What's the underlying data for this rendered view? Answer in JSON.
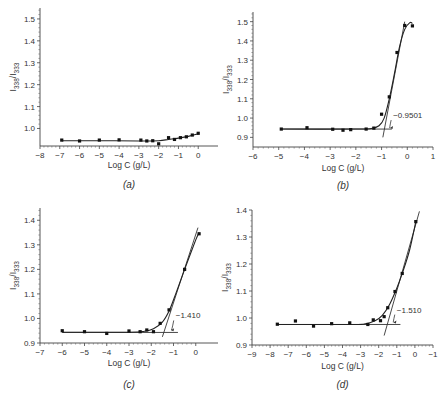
{
  "chart_data": [
    {
      "id": "a",
      "panel_label": "(a)",
      "type": "scatter",
      "xlabel": "Log C (g/L)",
      "ylabel": "I338/I333",
      "ylabel_main": "I",
      "ylabel_sub1": "338",
      "ylabel_sep": "/I",
      "ylabel_sub2": "333",
      "xlim": [
        -8,
        1
      ],
      "ylim": [
        0.92,
        1.55
      ],
      "xticks": [
        -8,
        -7,
        -6,
        -5,
        -4,
        -3,
        -2,
        -1,
        0
      ],
      "xtick_labels": [
        "−8",
        "−7",
        "−6",
        "−5",
        "−4",
        "−3",
        "−2",
        "−1",
        "0"
      ],
      "yticks": [
        1.0,
        1.1,
        1.2,
        1.3,
        1.4,
        1.5
      ],
      "ytick_labels": [
        "1.0",
        "1.1",
        "1.2",
        "1.3",
        "1.4",
        "1.5"
      ],
      "series": [
        {
          "name": "data",
          "x": [
            -6.9,
            -6.0,
            -5.0,
            -4.0,
            -2.9,
            -2.6,
            -2.3,
            -2.0,
            -1.5,
            -1.2,
            -0.9,
            -0.6,
            -0.3,
            0.0
          ],
          "y": [
            0.947,
            0.943,
            0.947,
            0.948,
            0.947,
            0.943,
            0.944,
            0.93,
            0.958,
            0.95,
            0.958,
            0.962,
            0.97,
            0.978
          ]
        }
      ],
      "fit_curve": {
        "x": [
          -6.9,
          -5.0,
          -3.0,
          -2.0,
          -1.5,
          -1.0,
          -0.5,
          0.0
        ],
        "y": [
          0.944,
          0.944,
          0.943,
          0.944,
          0.95,
          0.956,
          0.964,
          0.976
        ]
      },
      "annotation": null,
      "grid": false
    },
    {
      "id": "b",
      "panel_label": "(b)",
      "type": "scatter",
      "xlabel": "Log C (g/L)",
      "ylabel": "I338/I333",
      "ylabel_main": "I",
      "ylabel_sub1": "338",
      "ylabel_sep": "/I",
      "ylabel_sub2": "333",
      "xlim": [
        -6,
        1
      ],
      "ylim": [
        0.85,
        1.55
      ],
      "xticks": [
        -6,
        -5,
        -4,
        -3,
        -2,
        -1,
        0,
        1
      ],
      "xtick_labels": [
        "−6",
        "−5",
        "−4",
        "−3",
        "−2",
        "−1",
        "0",
        "1"
      ],
      "yticks": [
        0.9,
        1.0,
        1.1,
        1.2,
        1.3,
        1.4,
        1.5
      ],
      "ytick_labels": [
        "0.9",
        "1.0",
        "1.1",
        "1.2",
        "1.3",
        "1.4",
        "1.5"
      ],
      "series": [
        {
          "name": "data",
          "x": [
            -4.9,
            -3.9,
            -2.9,
            -2.5,
            -2.2,
            -1.6,
            -1.3,
            -1.0,
            -0.7,
            -0.4,
            -0.1,
            0.2
          ],
          "y": [
            0.943,
            0.95,
            0.942,
            0.937,
            0.94,
            0.943,
            0.948,
            1.02,
            1.11,
            1.34,
            1.48,
            1.478
          ]
        }
      ],
      "fit_curve": {
        "x": [
          -4.9,
          -2.0,
          -1.4,
          -1.1,
          -0.9,
          -0.7,
          -0.5,
          -0.3,
          -0.1,
          0.1,
          0.2
        ],
        "y": [
          0.943,
          0.943,
          0.946,
          0.96,
          1.0,
          1.1,
          1.23,
          1.37,
          1.46,
          1.495,
          1.49
        ]
      },
      "baseline": {
        "x": [
          -4.9,
          -0.6
        ],
        "y": [
          0.943,
          0.943
        ]
      },
      "tangent": {
        "x": [
          -0.95,
          -0.1
        ],
        "y": [
          0.9,
          1.5
        ]
      },
      "annotation": {
        "text": "−0.9501",
        "x": -0.75,
        "y": 0.943,
        "label_x": -0.55,
        "label_y": 1.0
      },
      "grid": false
    },
    {
      "id": "c",
      "panel_label": "(c)",
      "type": "scatter",
      "xlabel": "Log C (g/L)",
      "ylabel": "I338/I333",
      "ylabel_main": "I",
      "ylabel_sub1": "338",
      "ylabel_sep": "/I",
      "ylabel_sub2": "333",
      "xlim": [
        -7,
        1
      ],
      "ylim": [
        0.9,
        1.45
      ],
      "xticks": [
        -7,
        -6,
        -5,
        -4,
        -3,
        -2,
        -1,
        0
      ],
      "xtick_labels": [
        "−7",
        "−6",
        "−5",
        "−4",
        "−3",
        "−2",
        "−1",
        "0"
      ],
      "yticks": [
        0.9,
        1.0,
        1.1,
        1.2,
        1.3,
        1.4
      ],
      "ytick_labels": [
        "0.9",
        "1.0",
        "1.1",
        "1.2",
        "1.3",
        "1.4"
      ],
      "series": [
        {
          "name": "data",
          "x": [
            -6.0,
            -5.0,
            -4.0,
            -3.0,
            -2.5,
            -2.2,
            -1.9,
            -1.6,
            -1.2,
            -0.5,
            0.15
          ],
          "y": [
            0.95,
            0.946,
            0.939,
            0.949,
            0.946,
            0.953,
            0.946,
            0.98,
            1.035,
            1.2,
            1.345
          ]
        }
      ],
      "fit_curve": {
        "x": [
          -6.0,
          -3.0,
          -2.3,
          -1.9,
          -1.5,
          -1.2,
          -0.9,
          -0.5,
          0.0,
          0.15
        ],
        "y": [
          0.944,
          0.944,
          0.948,
          0.958,
          0.985,
          1.03,
          1.1,
          1.2,
          1.32,
          1.35
        ]
      },
      "baseline": {
        "x": [
          -6.0,
          -0.8
        ],
        "y": [
          0.943,
          0.943
        ]
      },
      "tangent": {
        "x": [
          -1.5,
          0.1
        ],
        "y": [
          0.925,
          1.37
        ]
      },
      "annotation": {
        "text": "−1.410",
        "x": -1.2,
        "y": 0.948,
        "label_x": -0.9,
        "label_y": 1.0
      },
      "grid": false
    },
    {
      "id": "d",
      "panel_label": "(d)",
      "type": "scatter",
      "xlabel": "Log C (g/L)",
      "ylabel": "I338/I333",
      "ylabel_main": "I",
      "ylabel_sub1": "338",
      "ylabel_sep": "/I",
      "ylabel_sub2": "333",
      "xlim": [
        -9,
        1
      ],
      "ylim": [
        0.9,
        1.4
      ],
      "xticks": [
        -9,
        -8,
        -7,
        -6,
        -5,
        -4,
        -3,
        -2,
        -1,
        0,
        1
      ],
      "xtick_labels": [
        "−9",
        "−8",
        "−7",
        "−6",
        "−5",
        "−4",
        "−3",
        "−2",
        "−1",
        "0",
        "−1"
      ],
      "yticks": [
        0.9,
        1.0,
        1.1,
        1.2,
        1.3,
        1.4
      ],
      "ytick_labels": [
        "0.9",
        "1.0",
        "1.1",
        "1.2",
        "1.3",
        "1.4"
      ],
      "series": [
        {
          "name": "data",
          "x": [
            -7.6,
            -6.6,
            -5.6,
            -4.6,
            -3.6,
            -2.6,
            -2.3,
            -1.9,
            -1.7,
            -1.5,
            -1.1,
            -0.7,
            0.05
          ],
          "y": [
            0.977,
            0.989,
            0.97,
            0.979,
            0.982,
            0.976,
            0.993,
            0.99,
            1.005,
            1.038,
            1.098,
            1.165,
            1.357
          ]
        }
      ],
      "fit_curve": {
        "x": [
          -7.6,
          -3.5,
          -2.8,
          -2.2,
          -1.8,
          -1.4,
          -1.0,
          -0.7,
          -0.3,
          0.05
        ],
        "y": [
          0.976,
          0.976,
          0.978,
          0.99,
          1.01,
          1.05,
          1.11,
          1.165,
          1.25,
          1.357
        ]
      },
      "baseline": {
        "x": [
          -7.6,
          -0.8
        ],
        "y": [
          0.976,
          0.976
        ]
      },
      "tangent": {
        "x": [
          -1.7,
          0.25
        ],
        "y": [
          0.935,
          1.395
        ]
      },
      "annotation": {
        "text": "−1.510",
        "x": -1.3,
        "y": 0.98,
        "label_x": -1.0,
        "label_y": 1.02
      },
      "grid": false
    }
  ]
}
